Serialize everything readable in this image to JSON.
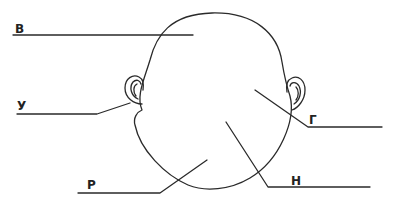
{
  "diagram": {
    "stroke_color": "#2a2a2a",
    "labels": [
      {
        "id": "v",
        "text": "В",
        "x": 15,
        "y": 22
      },
      {
        "id": "u",
        "text": "У",
        "x": 17,
        "y": 98
      },
      {
        "id": "r",
        "text": "Р",
        "x": 87,
        "y": 178
      },
      {
        "id": "g",
        "text": "Г",
        "x": 309,
        "y": 113
      },
      {
        "id": "n",
        "text": "Н",
        "x": 291,
        "y": 175
      }
    ]
  }
}
